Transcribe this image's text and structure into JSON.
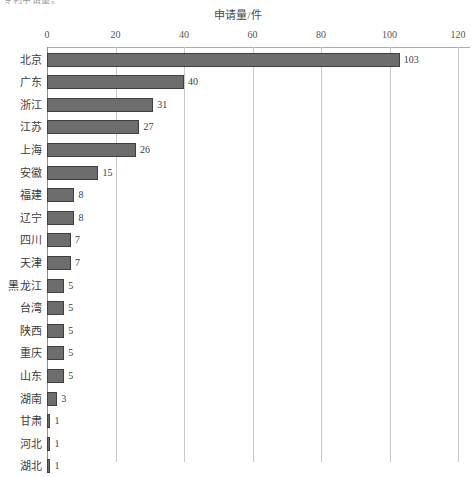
{
  "page": {
    "crop_remnant_text": "专利申请量。"
  },
  "chart_data": {
    "type": "bar",
    "orientation": "horizontal",
    "title": "申请量/件",
    "xlabel": "",
    "ylabel": "",
    "categories": [
      "北京",
      "广东",
      "浙江",
      "江苏",
      "上海",
      "安徽",
      "福建",
      "辽宁",
      "四川",
      "天津",
      "黑龙江",
      "台湾",
      "陕西",
      "重庆",
      "山东",
      "湖南",
      "甘肃",
      "河北",
      "湖北"
    ],
    "values": [
      103,
      40,
      31,
      27,
      26,
      15,
      8,
      8,
      7,
      7,
      5,
      5,
      5,
      5,
      5,
      3,
      1,
      1,
      1
    ],
    "xlim": [
      0,
      120
    ],
    "xticks": [
      0,
      20,
      40,
      60,
      80,
      100,
      120
    ],
    "xtick_labels": [
      "0",
      "20",
      "40",
      "60",
      "80",
      "100",
      "120"
    ],
    "grid": true,
    "legend": false,
    "data_labels": true,
    "bar_color": "#6d6d6d",
    "bar_border_color": "#3f3f3f",
    "grid_color": "#c9c9c9",
    "axis_color": "#8f8f8f",
    "text_color": "#3c3c3c"
  }
}
